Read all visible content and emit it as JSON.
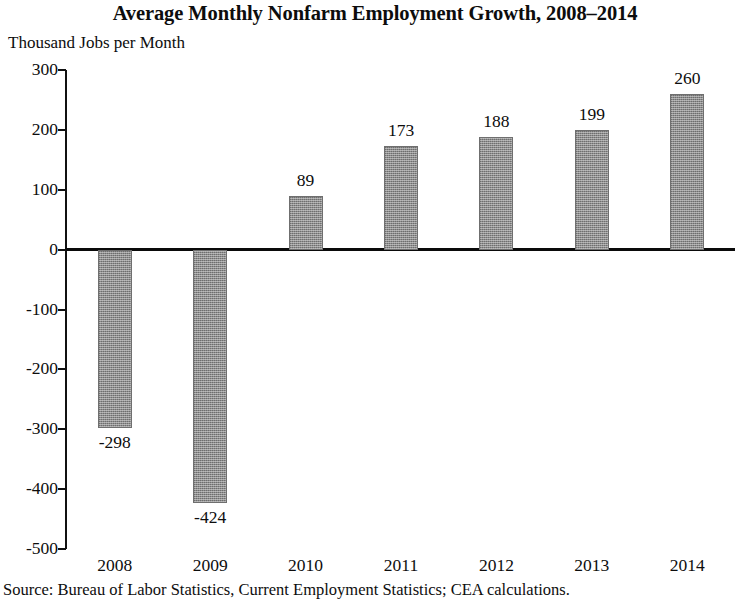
{
  "chart_data": {
    "type": "bar",
    "title": "Average Monthly Nonfarm Employment Growth, 2008–2014",
    "subtitle": "Thousand Jobs per Month",
    "ylabel": "Thousand Jobs per Month",
    "xlabel": "",
    "categories": [
      "2008",
      "2009",
      "2010",
      "2011",
      "2012",
      "2013",
      "2014"
    ],
    "values": [
      -298,
      -424,
      89,
      173,
      188,
      199,
      260
    ],
    "value_labels": [
      "-298",
      "-424",
      "89",
      "173",
      "188",
      "199",
      "260"
    ],
    "ylim": [
      -500,
      300
    ],
    "yticks": [
      300,
      200,
      100,
      0,
      -100,
      -200,
      -300,
      -400,
      -500
    ],
    "ytick_labels": [
      "300",
      "200",
      "100",
      "0",
      "-100",
      "-200",
      "-300",
      "-400",
      "-500"
    ],
    "grid": false,
    "legend": "none",
    "zero_line": true,
    "bar_color": "#8d8d8d",
    "axis_color": "#111111",
    "source": "Source: Bureau of Labor Statistics, Current Employment Statistics; CEA calculations."
  }
}
